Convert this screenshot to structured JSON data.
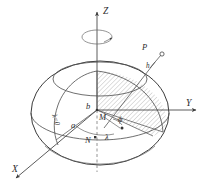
{
  "figure": {
    "type": "3d-geometry-diagram",
    "background_color": "#ffffff",
    "line_color": "#3a3a3a",
    "hatch_color": "#777777"
  },
  "axes": {
    "z": {
      "label": "Z",
      "direction": "up"
    },
    "y": {
      "label": "Y",
      "direction": "right"
    },
    "x": {
      "label": "X",
      "direction": "lower-left"
    }
  },
  "rotation_indicator": {
    "name": "spin-arrow",
    "description": "elliptical arrow around Z axis"
  },
  "labels": {
    "point_p": "P",
    "height_h": "h",
    "center_m": "M",
    "node_n": "N",
    "latitude_phi": "ϕ",
    "longitude_lambda": "λ",
    "prime_meridian": "λ=0",
    "semi_minor_b": "b",
    "semi_major_a": "a"
  },
  "elements": {
    "ellipsoid": "oblate-ellipsoid-of-revolution",
    "sector": "hatched-meridian-sector",
    "equator": "equatorial-circle",
    "parallel": "latitude-parallel-circle",
    "meridian": "prime-meridian-curve"
  }
}
